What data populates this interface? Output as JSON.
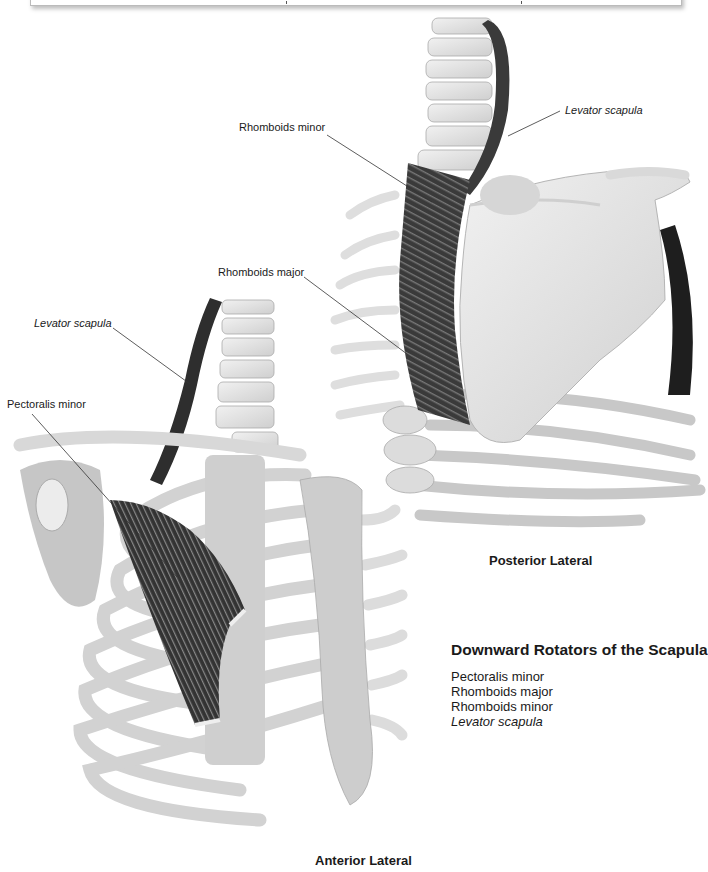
{
  "header_box": {
    "visible_text": ""
  },
  "labels": {
    "posterior": {
      "rhomboids_minor": "Rhomboids minor",
      "levator_scapula": "Levator scapula",
      "rhomboids_major": "Rhomboids major"
    },
    "anterior": {
      "levator_scapula": "Levator scapula",
      "pectoralis_minor": "Pectoralis minor"
    }
  },
  "views": {
    "posterior_title": "Posterior Lateral",
    "anterior_title": "Anterior Lateral"
  },
  "legend": {
    "title": "Downward Rotators of the Scapula",
    "items": [
      {
        "text": "Pectoralis minor",
        "italic": false
      },
      {
        "text": "Rhomboids major",
        "italic": false
      },
      {
        "text": "Rhomboids minor",
        "italic": false
      },
      {
        "text": "Levator scapula",
        "italic": true
      }
    ]
  },
  "colors": {
    "bone": "#e4e4e4",
    "bone_shade": "#c9c9c9",
    "muscle": "#3b3b3b",
    "line": "#333333"
  }
}
